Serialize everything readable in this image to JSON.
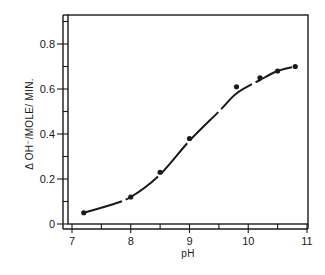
{
  "chart_data": {
    "type": "line",
    "title": "",
    "xlabel": "pH",
    "ylabel": "Δ OH⁻/MOLE/ MIN.",
    "xlim": [
      7,
      11
    ],
    "ylim": [
      0,
      0.9
    ],
    "xticks": [
      7,
      8,
      9,
      10,
      11
    ],
    "xtick_labels": [
      "7",
      "8",
      "9",
      "10",
      "11"
    ],
    "yticks": [
      0,
      0.2,
      0.4,
      0.6,
      0.8
    ],
    "ytick_labels": [
      "0",
      "0.2",
      "0.4",
      "0.6",
      "0.8"
    ],
    "grid": false,
    "legend": null,
    "series": [
      {
        "name": "measured",
        "style": "points",
        "x": [
          7.2,
          8.0,
          8.5,
          9.0,
          9.8,
          10.2,
          10.5,
          10.8
        ],
        "y": [
          0.05,
          0.12,
          0.23,
          0.38,
          0.61,
          0.65,
          0.68,
          0.7
        ]
      },
      {
        "name": "fitted curve",
        "style": "smooth-line",
        "x": [
          7.2,
          7.6,
          8.0,
          8.5,
          9.0,
          9.5,
          9.8,
          10.2,
          10.5,
          10.8
        ],
        "y": [
          0.05,
          0.08,
          0.12,
          0.22,
          0.37,
          0.5,
          0.58,
          0.64,
          0.68,
          0.7
        ]
      }
    ],
    "colors": {
      "ink": "#1a1a1a",
      "background": "#ffffff"
    }
  }
}
